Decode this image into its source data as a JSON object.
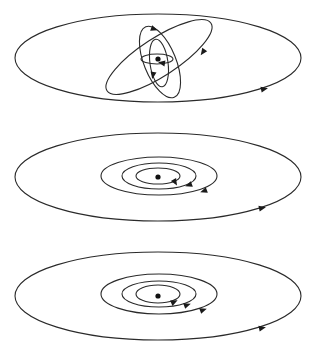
{
  "figure": {
    "caption": "Three stages of orbital flattening: randomly oriented orbits (top) collapse into a coplanar, concentric, co-rotating system (middle, bottom)",
    "stroke_color": "#2a2a2a",
    "background": "#ffffff",
    "panels": [
      {
        "name": "random-orbits",
        "label": "Panel 1: randomly inclined orbits",
        "center": [
          158,
          59
        ],
        "outer_orbit": {
          "cx": 158,
          "cy": 58,
          "rx": 143,
          "ry": 44,
          "arrow_at": [
            264,
            89
          ],
          "arrow_angle": -12
        },
        "inner_orbits": [
          {
            "cx": 159,
            "cy": 57,
            "rx": 62,
            "ry": 19,
            "rotate": -33,
            "arrow_at": [
              203,
              52
            ],
            "arrow_angle": 125
          },
          {
            "cx": 160,
            "cy": 62,
            "rx": 16,
            "ry": 38,
            "rotate": -22,
            "arrow_at": [
              154,
              29
            ],
            "arrow_angle": 20
          },
          {
            "cx": 159,
            "cy": 63,
            "rx": 9,
            "ry": 24,
            "rotate": -8,
            "arrow_at": [
              153,
              75
            ],
            "arrow_angle": 100
          },
          {
            "cx": 157,
            "cy": 59,
            "rx": 16,
            "ry": 5,
            "rotate": 0,
            "arrow_at": [
              162,
              63
            ],
            "arrow_angle": 190
          }
        ]
      },
      {
        "name": "coplanar-orbits",
        "label": "Panel 2: coplanar concentric orbits",
        "center": [
          158,
          177
        ],
        "outer_orbit": {
          "cx": 158,
          "cy": 177,
          "rx": 143,
          "ry": 44,
          "arrow_at": [
            262,
            208
          ],
          "arrow_angle": -12
        },
        "inner_orbits": [
          {
            "cx": 159,
            "cy": 176,
            "rx": 58,
            "ry": 19,
            "rotate": 0,
            "arrow_at": [
              204,
              191
            ],
            "arrow_angle": 160
          },
          {
            "cx": 159,
            "cy": 176,
            "rx": 37,
            "ry": 13,
            "rotate": 0,
            "arrow_at": [
              189,
              185
            ],
            "arrow_angle": 160
          },
          {
            "cx": 158,
            "cy": 176,
            "rx": 22,
            "ry": 8,
            "rotate": 0,
            "arrow_at": [
              175,
              182
            ],
            "arrow_angle": 60
          }
        ]
      },
      {
        "name": "co-rotating-orbits",
        "label": "Panel 3: co-rotating concentric orbits",
        "center": [
          158,
          296
        ],
        "outer_orbit": {
          "cx": 158,
          "cy": 296,
          "rx": 143,
          "ry": 44,
          "arrow_at": [
            262,
            328
          ],
          "arrow_angle": -12
        },
        "inner_orbits": [
          {
            "cx": 159,
            "cy": 294,
            "rx": 58,
            "ry": 20,
            "rotate": 0,
            "arrow_at": [
              203,
              310
            ],
            "arrow_angle": -20
          },
          {
            "cx": 159,
            "cy": 294,
            "rx": 37,
            "ry": 13,
            "rotate": 0,
            "arrow_at": [
              187,
              305
            ],
            "arrow_angle": -20
          },
          {
            "cx": 158,
            "cy": 294,
            "rx": 22,
            "ry": 9,
            "rotate": 0,
            "arrow_at": [
              174,
              302
            ],
            "arrow_angle": -25
          }
        ]
      }
    ]
  }
}
